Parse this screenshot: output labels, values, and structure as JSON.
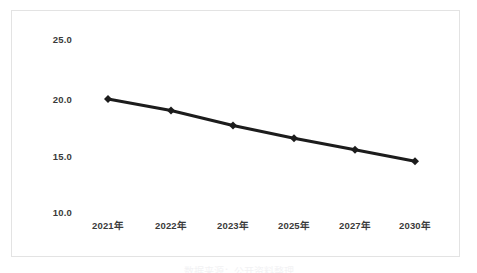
{
  "chart_data": {
    "type": "line",
    "title": "",
    "subtitle": "",
    "xlabel": "",
    "ylabel": "",
    "categories": [
      "2021年",
      "2022年",
      "2023年",
      "2025年",
      "2027年",
      "2030年"
    ],
    "values": [
      19.8,
      18.8,
      17.5,
      16.4,
      15.4,
      14.4
    ],
    "series": [
      {
        "name": "",
        "values": [
          19.8,
          18.8,
          17.5,
          16.4,
          15.4,
          14.4
        ]
      }
    ],
    "ylim": [
      10.0,
      25.0
    ],
    "y_ticks": [
      "25.0",
      "20.0",
      "15.0",
      "10.0"
    ],
    "y_tick_values": [
      25.0,
      20.0,
      15.0,
      10.0
    ],
    "x_ticks": [
      "2021年",
      "2022年",
      "2023年",
      "2025年",
      "2027年",
      "2030年"
    ],
    "grid": false,
    "legend": "none",
    "line_color": "#1c1c1c",
    "marker": "diamond",
    "marker_color": "#1c1c1c",
    "axis_label_color": "#3a3a3a",
    "frame_color": "#e3e3e3",
    "background_color": "#ffffff"
  },
  "caption": {
    "bottom_text": "数据来源：公开资料整理"
  }
}
